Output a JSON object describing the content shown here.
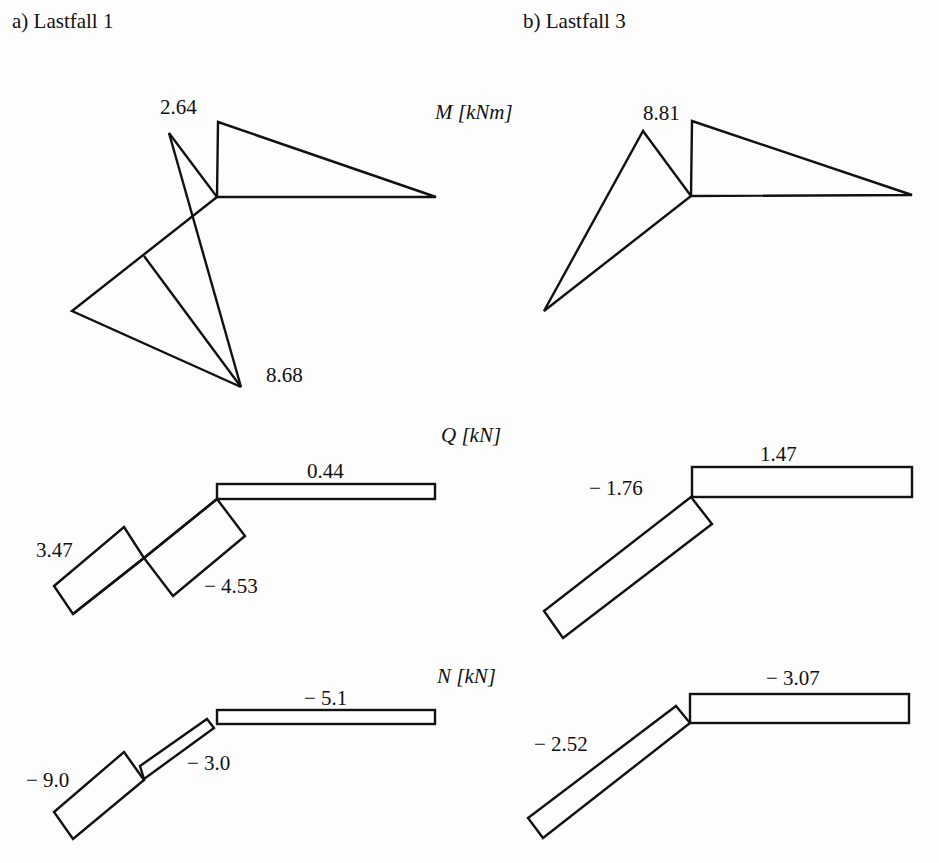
{
  "panels": {
    "a": {
      "title": "a) Lastfall 1"
    },
    "b": {
      "title": "b) Lastfall 3"
    }
  },
  "quantities": {
    "M": {
      "symbol": "M",
      "unit": "[kNm]"
    },
    "Q": {
      "symbol": "Q",
      "unit": "[kN]"
    },
    "N": {
      "symbol": "N",
      "unit": "[kN]"
    }
  },
  "values": {
    "a": {
      "M_top": "2.64",
      "M_bottom": "8.68",
      "Q_horizontal": "0.44",
      "Q_left": "3.47",
      "Q_right": "− 4.53",
      "N_horizontal": "− 5.1",
      "N_left": "− 9.0",
      "N_upper": "− 3.0"
    },
    "b": {
      "M_top": "8.81",
      "Q_horizontal": "1.47",
      "Q_diagonal": "− 1.76",
      "N_horizontal": "− 3.07",
      "N_diagonal": "− 2.52"
    }
  },
  "colors": {
    "ink": "#111111",
    "paper": "#fdfdfd"
  }
}
